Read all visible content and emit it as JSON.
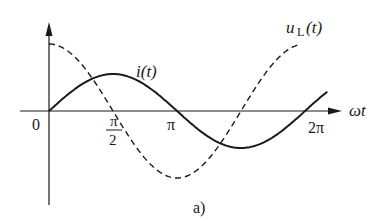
{
  "figure": {
    "caption": "a)",
    "axes": {
      "origin_label": "0",
      "x_axis_label": "ωt",
      "x_ticks": [
        {
          "num": "π",
          "den": "2",
          "label": "π/2"
        },
        {
          "label": "π"
        },
        {
          "label": "2π"
        }
      ]
    },
    "curves": [
      {
        "name": "current",
        "label": "i(t)",
        "style": "solid",
        "function": "sin(ωt)"
      },
      {
        "name": "inductor-voltage",
        "label_main": "u",
        "label_sub": "L",
        "label_arg": "(t)",
        "style": "dashed",
        "function": "cos(ωt)"
      }
    ],
    "colors": {
      "ink": "#1a1a1a",
      "background": "#ffffff"
    }
  }
}
